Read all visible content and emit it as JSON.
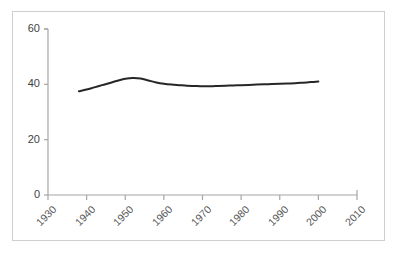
{
  "chart_data": {
    "type": "line",
    "title": "",
    "subtitle": "",
    "xlabel": "",
    "ylabel": "",
    "xlim": [
      1930,
      2010
    ],
    "ylim": [
      0,
      60
    ],
    "xticks": [
      1930,
      1940,
      1950,
      1960,
      1970,
      1980,
      1990,
      2000,
      2010
    ],
    "xtick_labels": [
      "1930",
      "1940",
      "1950",
      "1960",
      "1970",
      "1980",
      "1990",
      "2000",
      "2010"
    ],
    "yticks": [
      0,
      20,
      40,
      60
    ],
    "ytick_labels": [
      "0",
      "20",
      "40",
      "60"
    ],
    "grid": false,
    "legend": null,
    "legend_position": "none",
    "xtick_label_rotation_deg": -45,
    "series": [
      {
        "name": "series-1",
        "color": "#262626",
        "line_width": 2,
        "markers": false,
        "x": [
          1938,
          1940,
          1942,
          1944,
          1946,
          1948,
          1950,
          1952,
          1954,
          1956,
          1958,
          1960,
          1962,
          1964,
          1966,
          1968,
          1970,
          1972,
          1974,
          1976,
          1978,
          1980,
          1982,
          1984,
          1986,
          1988,
          1990,
          1992,
          1994,
          1996,
          1998,
          2000
        ],
        "values": [
          37.5,
          38.1,
          38.9,
          39.7,
          40.5,
          41.3,
          42.0,
          42.3,
          42.1,
          41.4,
          40.7,
          40.2,
          39.9,
          39.7,
          39.5,
          39.4,
          39.3,
          39.3,
          39.4,
          39.5,
          39.6,
          39.7,
          39.8,
          39.9,
          40.0,
          40.1,
          40.2,
          40.3,
          40.4,
          40.6,
          40.8,
          41.0
        ]
      }
    ],
    "colors": {
      "line": "#262626",
      "axis": "#a6a6a6",
      "frame": "#cfcfcf",
      "ytick_text": "#3f3f3f",
      "xtick_text": "#595959",
      "background": "#ffffff"
    }
  }
}
